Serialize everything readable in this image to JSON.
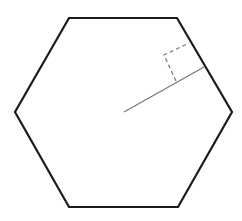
{
  "diagram": {
    "type": "regular-hexagon-with-apothem",
    "hexagon": {
      "vertices": [
        [
          69,
          18
        ],
        [
          177,
          18
        ],
        [
          232,
          112
        ],
        [
          178,
          207
        ],
        [
          69,
          207
        ],
        [
          15,
          112
        ]
      ],
      "stroke": "#1a1a1a",
      "stroke_width": 2.2
    },
    "apothem": {
      "from": [
        124,
        112
      ],
      "to": [
        204,
        67
      ],
      "stroke": "#777777",
      "stroke_width": 1.2
    },
    "right_angle_marker": {
      "points": [
        [
          176,
          81
        ],
        [
          164,
          55
        ],
        [
          189,
          43
        ]
      ],
      "stroke": "#777777",
      "dash": "4,3"
    }
  }
}
